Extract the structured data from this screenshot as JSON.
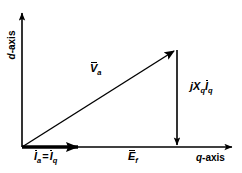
{
  "figure": {
    "background_color": "#ffffff",
    "line_color": "#000000",
    "width": 242,
    "height": 173
  },
  "axes": {
    "d_axis": {
      "label_var": "d",
      "label_suffix": "-axis",
      "full_label": "d-axis",
      "orientation": "vertical",
      "direction": "up",
      "arrow": true
    },
    "q_axis": {
      "label_var": "q",
      "label_suffix": "-axis",
      "full_label": "q-axis",
      "orientation": "horizontal",
      "direction": "right",
      "arrow": true
    },
    "origin": {
      "x": 22,
      "y": 147
    }
  },
  "vectors": {
    "va": {
      "symbol": "V",
      "subscript": "a",
      "overbar": true,
      "full_label": "V̄a",
      "description": "terminal voltage phasor",
      "from": {
        "x": 22,
        "y": 147
      },
      "to": {
        "x": 177,
        "y": 49
      },
      "arrow": true,
      "weight": "thin"
    },
    "ia": {
      "symbol": "I",
      "subscript": "a",
      "overbar": true,
      "equals": "=",
      "symbol2": "I",
      "subscript2": "q",
      "full_label": "Īa = Īq",
      "description": "armature current phasor equals q-axis current",
      "from": {
        "x": 22,
        "y": 147
      },
      "to": {
        "x": 89,
        "y": 147
      },
      "arrow": true,
      "weight": "thick"
    },
    "ef": {
      "symbol": "E",
      "subscript": "f",
      "overbar": true,
      "full_label": "Ēf",
      "description": "excitation voltage phasor along q-axis",
      "from": {
        "x": 22,
        "y": 147
      },
      "to": {
        "x": 177,
        "y": 147
      },
      "arrow": false,
      "weight": "thin"
    },
    "jxqiq": {
      "symbol": "jX",
      "subscript": "q",
      "symbol2": "I",
      "subscript2": "q",
      "overbar2": true,
      "full_label": "jXqĪq",
      "description": "quadrature reactance voltage drop",
      "from": {
        "x": 177,
        "y": 49
      },
      "to": {
        "x": 177,
        "y": 147
      },
      "arrow": true,
      "weight": "thin"
    }
  }
}
